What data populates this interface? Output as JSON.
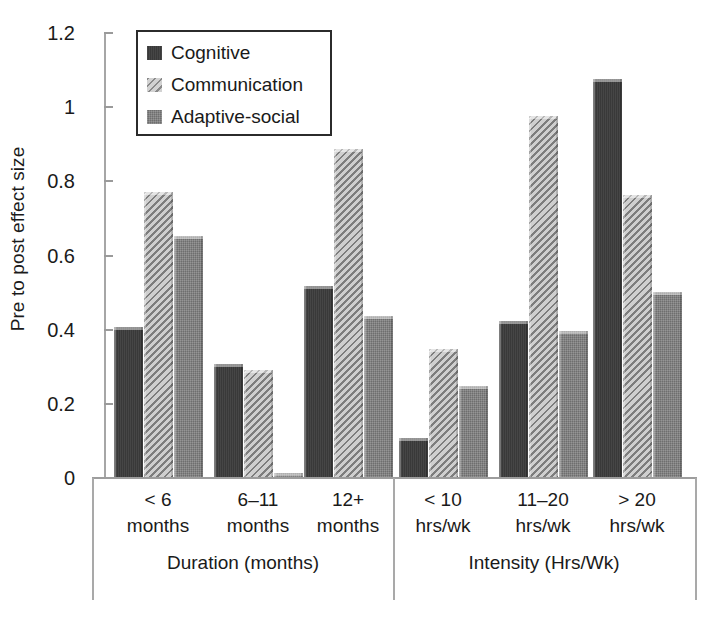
{
  "chart_data": {
    "type": "bar",
    "title": "",
    "xlabel": "",
    "ylabel": "Pre to post effect size",
    "ylim": [
      0,
      1.2
    ],
    "yticks": [
      "0",
      "0.2",
      "0.4",
      "0.6",
      "0.8",
      "1",
      "1.2"
    ],
    "ytick_values": [
      0,
      0.2,
      0.4,
      0.6,
      0.8,
      1,
      1.2
    ],
    "grid": false,
    "legend_position": "top-left",
    "categories": [
      "< 6 months",
      "6–11 months",
      "12+ months",
      "< 10 hrs/wk",
      "11–20 hrs/wk",
      "> 20 hrs/wk"
    ],
    "category_lines": [
      [
        "< 6",
        "months"
      ],
      [
        "6–11",
        "months"
      ],
      [
        "12+",
        "months"
      ],
      [
        "< 10",
        "hrs/wk"
      ],
      [
        "11–20",
        "hrs/wk"
      ],
      [
        "> 20",
        "hrs/wk"
      ]
    ],
    "panels": [
      {
        "title": "Duration (months)",
        "categories": [
          0,
          1,
          2
        ]
      },
      {
        "title": "Intensity (Hrs/Wk)",
        "categories": [
          3,
          4,
          5
        ]
      }
    ],
    "series": [
      {
        "name": "Cognitive",
        "color": "#3c3c3c",
        "pattern": "solid-dark",
        "values": [
          0.41,
          0.31,
          0.52,
          0.11,
          0.425,
          1.08
        ]
      },
      {
        "name": "Communication",
        "color": "#b3b3b3",
        "pattern": "diagonal-hatch",
        "values": [
          0.775,
          0.295,
          0.89,
          0.35,
          0.98,
          0.765
        ]
      },
      {
        "name": "Adaptive-social",
        "color": "#7c7c7c",
        "pattern": "dotted-gray",
        "values": [
          0.655,
          0.015,
          0.44,
          0.25,
          0.4,
          0.505
        ]
      }
    ]
  },
  "legend": {
    "items": [
      {
        "label": "Cognitive",
        "swatch": "legend-swatch-cognitive"
      },
      {
        "label": "Communication",
        "swatch": "legend-swatch-communication"
      },
      {
        "label": "Adaptive-social",
        "swatch": "legend-swatch-adaptive-social"
      }
    ]
  }
}
